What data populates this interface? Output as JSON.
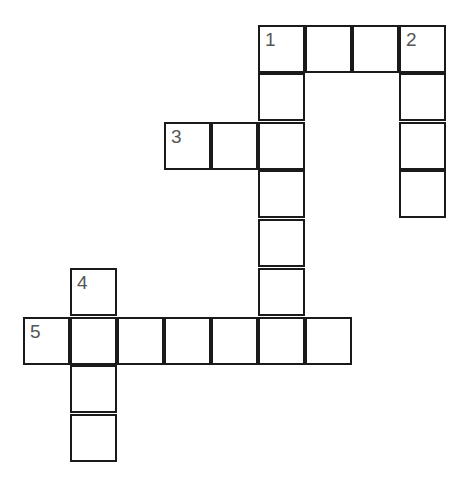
{
  "puzzle": {
    "type": "crossword",
    "cell_size": 47,
    "clue_numbers": [
      "1",
      "2",
      "3",
      "4",
      "5"
    ],
    "cells": [
      {
        "x": 259,
        "y": 26,
        "num": "1"
      },
      {
        "x": 306,
        "y": 26
      },
      {
        "x": 353,
        "y": 26
      },
      {
        "x": 400,
        "y": 26,
        "num": "2"
      },
      {
        "x": 259,
        "y": 74
      },
      {
        "x": 400,
        "y": 74
      },
      {
        "x": 400,
        "y": 123
      },
      {
        "x": 400,
        "y": 171
      },
      {
        "x": 165,
        "y": 123,
        "num": "3"
      },
      {
        "x": 212,
        "y": 123
      },
      {
        "x": 259,
        "y": 123
      },
      {
        "x": 259,
        "y": 171
      },
      {
        "x": 259,
        "y": 220
      },
      {
        "x": 259,
        "y": 269
      },
      {
        "x": 71,
        "y": 269,
        "num": "4"
      },
      {
        "x": 24,
        "y": 318,
        "num": "5"
      },
      {
        "x": 71,
        "y": 318
      },
      {
        "x": 118,
        "y": 318
      },
      {
        "x": 165,
        "y": 318
      },
      {
        "x": 212,
        "y": 318
      },
      {
        "x": 259,
        "y": 318
      },
      {
        "x": 306,
        "y": 318
      },
      {
        "x": 71,
        "y": 366
      },
      {
        "x": 71,
        "y": 415
      }
    ]
  }
}
